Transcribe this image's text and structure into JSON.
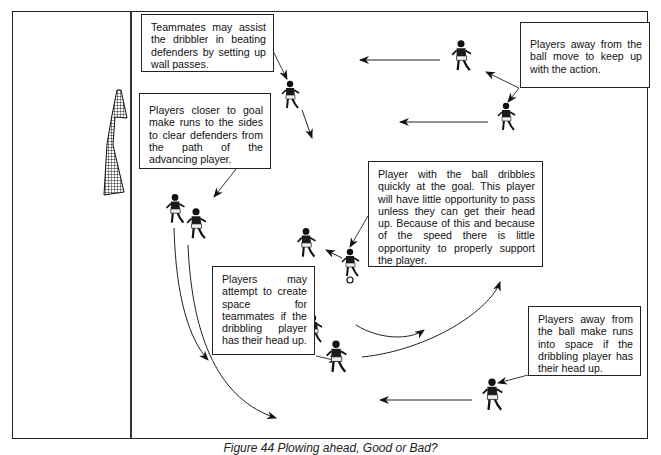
{
  "figure": {
    "caption": "Figure 44 Plowing ahead, Good or Bad?"
  },
  "callouts": [
    {
      "id": "wall-passes",
      "text": "Teammates may assist the dribbler in beating defenders by setting up wall passes."
    },
    {
      "id": "keep-up",
      "text": "Players away from the ball move to keep up with the action."
    },
    {
      "id": "clear-defenders",
      "text": "Players closer to goal make runs to the sides to clear defenders from the path of the advancing player."
    },
    {
      "id": "dribbler",
      "text": "Player with the ball dribbles quickly at the goal. This player will have little opportunity to pass unless they can get their head up. Because of this and because of the speed there is little opportunity to properly support the player."
    },
    {
      "id": "create-space",
      "text": "Players may attempt to create space for teammates if the dribbling player has their head up."
    },
    {
      "id": "runs-into-space",
      "text": "Players away from the ball make runs into space if the dribbling player has their head up."
    }
  ],
  "icons": {
    "goal": "goal-net-icon",
    "player": "player-figure-icon",
    "ball": "soccer-ball-icon",
    "arrow": "movement-arrow-icon"
  },
  "colors": {
    "ink": "#111111",
    "frame": "#222222",
    "background": "#ffffff"
  }
}
